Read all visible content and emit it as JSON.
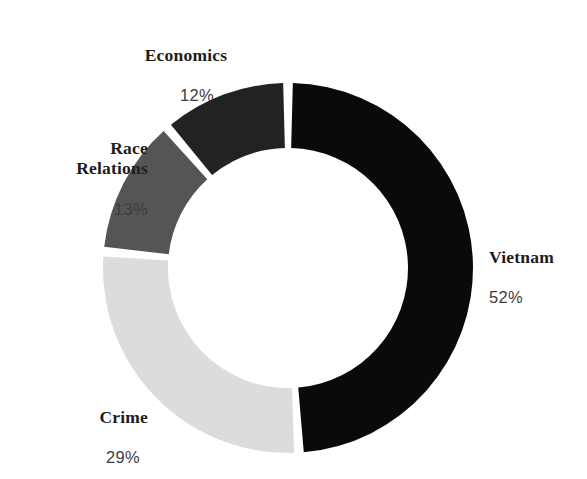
{
  "chart_data": {
    "type": "pie",
    "variant": "donut",
    "title": "",
    "subtitle": "",
    "xlabel": "",
    "ylabel": "",
    "legend": "none",
    "grid": false,
    "units": "percent",
    "total": "100%",
    "start_angle_deg": 0,
    "direction": "clockwise",
    "inner_radius_ratio": 0.65,
    "slice_gap_deg": 3,
    "categories": [
      "Vietnam",
      "Crime",
      "Race Relations",
      "Economics"
    ],
    "values": [
      52,
      29,
      13,
      12
    ],
    "slices": [
      {
        "label": "Vietnam",
        "label_display": "Vietnam",
        "value": 52,
        "value_display": "52%",
        "color": "#0a0a0a",
        "label_position": "right"
      },
      {
        "label": "Crime",
        "label_display": "Crime",
        "value": 29,
        "value_display": "29%",
        "color": "#dcdcdc",
        "label_position": "bottom-left"
      },
      {
        "label": "Race Relations",
        "label_display": "Race\nRelations",
        "value": 13,
        "value_display": "13%",
        "color": "#555555",
        "label_position": "left"
      },
      {
        "label": "Economics",
        "label_display": "Economics",
        "value": 12,
        "value_display": "12%",
        "color": "#222222",
        "label_position": "top"
      }
    ],
    "background_color": "#ffffff",
    "geometry": {
      "center_x": 288,
      "center_y": 268,
      "outer_radius": 185,
      "inner_radius": 120
    }
  }
}
